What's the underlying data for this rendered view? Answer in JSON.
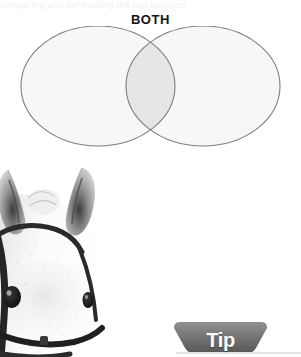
{
  "page": {
    "background_color": "#ffffff",
    "width": 301,
    "height": 357,
    "top_cut_text": "comparing and contrasting the two subjects"
  },
  "venn": {
    "label": "BOTH",
    "label_color": "#151515",
    "outline_color": "#7d7d7d",
    "circle_fill": "#f7f7f7",
    "overlap_fill": "#e6e6e6",
    "left_circle": {
      "name": "left-set-ellipse",
      "cx": 98,
      "cy": 60,
      "rx": 77,
      "ry": 60
    },
    "right_circle": {
      "name": "right-set-ellipse",
      "cx": 203,
      "cy": 60,
      "rx": 77,
      "ry": 60
    }
  },
  "photo": {
    "subject": "white-horse-head-with-bridle",
    "description": "Cropped photograph of a grey and white horse's head wearing a dark leather bridle",
    "coat_color": "#f2f2f2",
    "shadow_color": "#b9b9b9",
    "bridle_color": "#2a2a2a"
  },
  "tip": {
    "label": "Tip",
    "banner_color_light": "#8e8e8e",
    "banner_color_dark": "#5d5d5d",
    "text_color": "#ffffff",
    "underline_color": "#e3e3e3"
  }
}
